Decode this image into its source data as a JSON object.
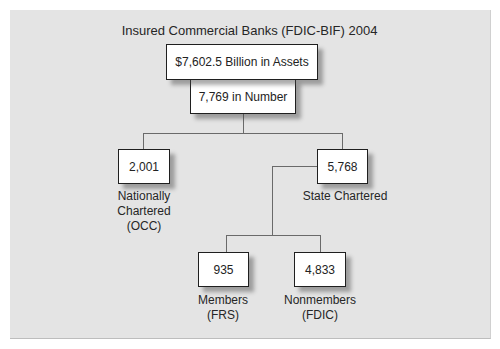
{
  "title": "Insured Commercial Banks (FDIC-BIF) 2004",
  "root": {
    "assets": "$7,602.5 Billion in Assets",
    "number": "7,769 in Number"
  },
  "national": {
    "value": "2,001",
    "label_lines": [
      "Nationally",
      "Chartered",
      "(OCC)"
    ]
  },
  "state": {
    "value": "5,768",
    "label": "State Chartered"
  },
  "members": {
    "value": "935",
    "label_lines": [
      "Members",
      "(FRS)"
    ]
  },
  "nonmembers": {
    "value": "4,833",
    "label_lines": [
      "Nonmembers",
      "(FDIC)"
    ]
  },
  "colors": {
    "panel_background": "#e4e4e4",
    "box_fill": "#ffffff",
    "box_border": "#1f1f1f",
    "connector": "#6a6a6a"
  }
}
